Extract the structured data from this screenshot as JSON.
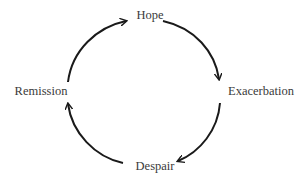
{
  "diagram": {
    "type": "cycle",
    "stroke_color": "#1a1a1a",
    "text_color": "#3a3a3a",
    "nodes": [
      {
        "id": "hope",
        "label": "Hope",
        "x": 150,
        "y": 15
      },
      {
        "id": "exacerbation",
        "label": "Exacerbation",
        "x": 261,
        "y": 91
      },
      {
        "id": "despair",
        "label": "Despair",
        "x": 155,
        "y": 166
      },
      {
        "id": "remission",
        "label": "Remission",
        "x": 41,
        "y": 91
      }
    ],
    "edges": [
      {
        "from": "hope",
        "to": "exacerbation"
      },
      {
        "from": "exacerbation",
        "to": "despair"
      },
      {
        "from": "despair",
        "to": "remission"
      },
      {
        "from": "remission",
        "to": "hope"
      }
    ]
  }
}
